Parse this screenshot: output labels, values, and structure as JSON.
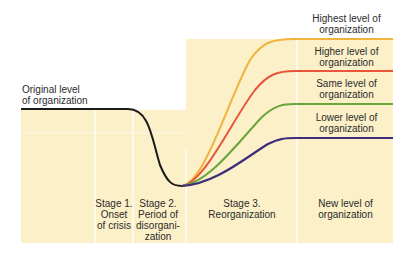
{
  "diagram": {
    "original_level_label": [
      "Original level",
      "of organization"
    ],
    "outcome_labels": [
      {
        "line1": "Highest level of",
        "line2": "organization",
        "color": "#f0b43c"
      },
      {
        "line1": "Higher level of",
        "line2": "organization",
        "color": "#e8553a"
      },
      {
        "line1": "Same level of",
        "line2": "organization",
        "color": "#6aa53c"
      },
      {
        "line1": "Lower level of",
        "line2": "organization",
        "color": "#3d2d7a"
      }
    ],
    "stages": [
      {
        "line1": "Stage 1.",
        "line2": "Onset",
        "line3": "of crisis",
        "line4": ""
      },
      {
        "line1": "Stage 2.",
        "line2": "Period of",
        "line3": "disorgani-",
        "line4": "zation"
      },
      {
        "line1": "Stage 3.",
        "line2": "Reorganization",
        "line3": "",
        "line4": ""
      },
      {
        "line1": "New level of",
        "line2": "organization",
        "line3": "",
        "line4": ""
      }
    ],
    "colors": {
      "panel": "#fbf0c8",
      "divider": "#ffffff",
      "original_line": "#1a1a1a"
    }
  }
}
